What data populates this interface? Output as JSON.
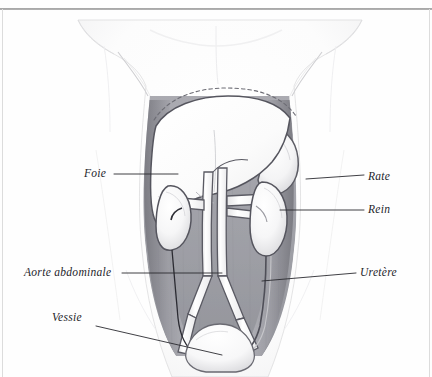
{
  "page": {
    "width": 432,
    "height": 377,
    "background_color": "#fefefe",
    "rule_color": "#9a9a9a",
    "kind": "scanned-anatomical-plate"
  },
  "illustration": {
    "title": "Abdomen humain - coupe frontale (dessin au crayon)",
    "subject": "human abdominal viscera, frontal view",
    "style": "graphite pencil shading on paper",
    "ink_color": "#2a2a30",
    "shade_dark": "#8d8d93",
    "shade_mid": "#b4b4ba",
    "organ_fill": "#fbfbfb",
    "skin_tone": "#fbfbfc",
    "structures": [
      "torso outline with rib margin and hips",
      "dashed diaphragm outline above liver",
      "liver (large pale lobe, upper left and centre)",
      "spleen (crescent, upper right)",
      "right kidney (viewer left)",
      "left kidney (viewer right)",
      "abdominal aorta and inferior vena cava descending centrally",
      "renal arteries and veins",
      "common iliac bifurcation",
      "ureters descending to bladder",
      "urinary bladder (rounded dome, bottom centre)"
    ]
  },
  "labels": [
    {
      "id": "foie",
      "text": "Foie",
      "side": "left"
    },
    {
      "id": "aorte",
      "text": "Aorte abdominale",
      "side": "left"
    },
    {
      "id": "vessie",
      "text": "Vessie",
      "side": "left"
    },
    {
      "id": "rate",
      "text": "Rate",
      "side": "right"
    },
    {
      "id": "rein",
      "text": "Rein",
      "side": "right"
    },
    {
      "id": "uretere",
      "text": "Uretère",
      "side": "right"
    }
  ]
}
